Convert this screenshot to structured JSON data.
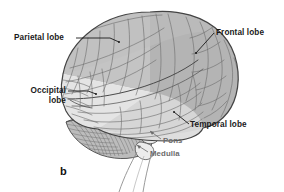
{
  "figure": {
    "letter": "b",
    "background_color": "#ffffff",
    "caption_text_color": "#111111"
  },
  "labels": {
    "parietal": "Parietal lobe",
    "frontal": "Frontal lobe",
    "occipital_line1": "Occipital",
    "occipital_line2": "lobe",
    "temporal": "Temporal lobe",
    "pons": "Pons",
    "medulla": "Medulla"
  },
  "colors": {
    "outline": "#4a4a4a",
    "frontal_fill": "#b6b6b6",
    "parietal_fill": "#c2c2c2",
    "occipital_fill": "#e2e2e2",
    "temporal_fill": "#dcdcdc",
    "cerebellum_fill": "#b9b9b9",
    "brainstem_fill": "#f0f0f0",
    "sulci_stroke": "#6e6e6e",
    "label_text": "#1a1a1a",
    "label_text_soft": "#6b6b6b",
    "leader_line": "#1a1a1a",
    "leader_line_soft": "#6b6b6b"
  },
  "structures": [
    {
      "name": "cerebrum",
      "region": "frontal lobe"
    },
    {
      "name": "cerebrum",
      "region": "parietal lobe"
    },
    {
      "name": "cerebrum",
      "region": "occipital lobe"
    },
    {
      "name": "cerebrum",
      "region": "temporal lobe"
    },
    {
      "name": "cerebellum",
      "region": "cerebellum"
    },
    {
      "name": "brainstem",
      "region": "pons"
    },
    {
      "name": "brainstem",
      "region": "medulla"
    }
  ]
}
